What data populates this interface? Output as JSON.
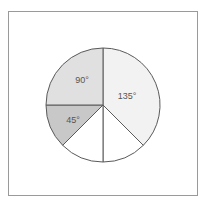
{
  "figure": {
    "background_color": "#ffffff",
    "frame": {
      "name": "outer-frame",
      "border_color": "#9a9a9a",
      "x": 8,
      "y": 11,
      "width": 190,
      "height": 185
    }
  },
  "chart_data": {
    "type": "pie",
    "title": "",
    "xlabel": "",
    "ylabel": "",
    "grid": false,
    "legend": "none",
    "units": "degrees",
    "total_degrees": 360,
    "center": {
      "x": 103,
      "y": 105
    },
    "radius": 57,
    "start_angle_deg": 0,
    "direction": "clockwise",
    "stroke_color": "#5a5a5a",
    "categories": [
      "135°",
      "unlabeled-1",
      "unlabeled-2",
      "45°",
      "90°"
    ],
    "values": [
      135,
      45,
      45,
      45,
      90
    ],
    "slices": [
      {
        "label": "135°",
        "label_visible": true,
        "value": 135,
        "start_deg": 0,
        "end_deg": 135,
        "fill": "#f2f2f2",
        "label_x": 127,
        "label_y": 97
      },
      {
        "label": "",
        "label_visible": false,
        "value": 45,
        "start_deg": 135,
        "end_deg": 180,
        "fill": "#ffffff",
        "label_x": 0,
        "label_y": 0
      },
      {
        "label": "",
        "label_visible": false,
        "value": 45,
        "start_deg": 180,
        "end_deg": 225,
        "fill": "#ffffff",
        "label_x": 0,
        "label_y": 0
      },
      {
        "label": "45°",
        "label_visible": true,
        "value": 45,
        "start_deg": 225,
        "end_deg": 270,
        "fill": "#c8c8c8",
        "label_x": 73,
        "label_y": 121
      },
      {
        "label": "90°",
        "label_visible": true,
        "value": 90,
        "start_deg": 270,
        "end_deg": 360,
        "fill": "#e0e0e0",
        "label_x": 82,
        "label_y": 81
      }
    ]
  }
}
